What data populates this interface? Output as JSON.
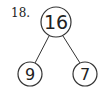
{
  "problem": {
    "number_label": "18.",
    "whole": "16",
    "parts": [
      "9",
      "7"
    ]
  }
}
